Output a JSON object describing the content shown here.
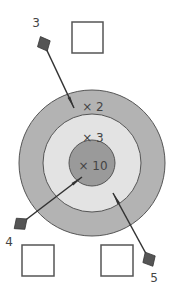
{
  "target": {
    "center": [
      92,
      163
    ],
    "rings": [
      {
        "name": "outer",
        "radius": 73,
        "color": "#b3b3b3",
        "label": "× 2",
        "label_pos": [
          93,
          106
        ]
      },
      {
        "name": "middle",
        "radius": 49,
        "color": "#e3e3e3",
        "label": "× 3",
        "label_pos": [
          93,
          137
        ]
      },
      {
        "name": "inner",
        "radius": 23,
        "color": "#9a9a9a",
        "label": "× 10",
        "label_pos": [
          93,
          165
        ]
      }
    ],
    "stroke": "#555555"
  },
  "boxes": [
    {
      "name": "answer-box-top",
      "x": 72,
      "y": 22,
      "w": 31,
      "h": 31
    },
    {
      "name": "answer-box-bottom-left",
      "x": 22,
      "y": 245,
      "w": 32,
      "h": 31
    },
    {
      "name": "answer-box-bottom-right",
      "x": 101,
      "y": 245,
      "w": 32,
      "h": 31
    }
  ],
  "darts": [
    {
      "label": "3",
      "label_pos": [
        36,
        27
      ],
      "tail": [
        43,
        42
      ],
      "tip": [
        74,
        108
      ]
    },
    {
      "label": "4",
      "label_pos": [
        9,
        246
      ],
      "tail": [
        19,
        225
      ],
      "tip": [
        82,
        177
      ]
    },
    {
      "label": "5",
      "label_pos": [
        154,
        282
      ],
      "tail": [
        150,
        261
      ],
      "tip": [
        113,
        193
      ]
    }
  ],
  "colors": {
    "dart": "#555555",
    "shaft": "#333333",
    "box_stroke": "#555555",
    "text": "#444444"
  }
}
